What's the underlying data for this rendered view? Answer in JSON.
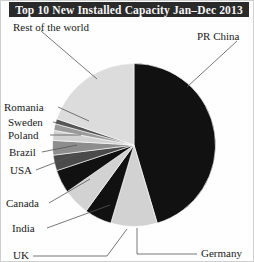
{
  "title": "Top 10 New Installed Capacity Jan–Dec 2013",
  "chart_data": {
    "type": "pie",
    "title": "Top 10 New Installed Capacity Jan–Dec 2013",
    "xlabel": "",
    "ylabel": "",
    "legend": "none",
    "grid": false,
    "units": "share of new installed wind capacity",
    "start_angle_deg": 0,
    "direction": "clockwise",
    "categories": [
      "PR China",
      "Germany",
      "UK",
      "India",
      "Canada",
      "USA",
      "Brazil",
      "Poland",
      "Sweden",
      "Romania",
      "Rest of the world"
    ],
    "values": [
      45.4,
      9.2,
      5.4,
      5.3,
      4.6,
      3.1,
      2.9,
      2.0,
      1.3,
      1.0,
      19.8
    ],
    "colors": [
      "#111111",
      "#d2d2d2",
      "#111111",
      "#d2d2d2",
      "#111111",
      "#4a4a4a",
      "#8d8d8d",
      "#d2d2d2",
      "#9a9a9a",
      "#555555",
      "#dcdcdc"
    ],
    "slices": [
      {
        "label": "PR China",
        "value": 45.4,
        "color": "#111111"
      },
      {
        "label": "Germany",
        "value": 9.2,
        "color": "#d2d2d2"
      },
      {
        "label": "UK",
        "value": 5.4,
        "color": "#111111"
      },
      {
        "label": "India",
        "value": 5.3,
        "color": "#d2d2d2"
      },
      {
        "label": "Canada",
        "value": 4.6,
        "color": "#111111"
      },
      {
        "label": "USA",
        "value": 3.1,
        "color": "#4a4a4a"
      },
      {
        "label": "Brazil",
        "value": 2.9,
        "color": "#8d8d8d"
      },
      {
        "label": "Poland",
        "value": 2.0,
        "color": "#d2d2d2"
      },
      {
        "label": "Sweden",
        "value": 1.3,
        "color": "#9a9a9a"
      },
      {
        "label": "Romania",
        "value": 1.0,
        "color": "#555555"
      },
      {
        "label": "Rest of the world",
        "value": 19.8,
        "color": "#dcdcdc"
      }
    ]
  },
  "labels": {
    "rest_of_the_world": "Rest of the world",
    "pr_china": "PR China",
    "romania": "Romania",
    "sweden": "Sweden",
    "poland": "Poland",
    "brazil": "Brazil",
    "usa": "USA",
    "canada": "Canada",
    "india": "India",
    "uk": "UK",
    "germany": "Germany"
  }
}
